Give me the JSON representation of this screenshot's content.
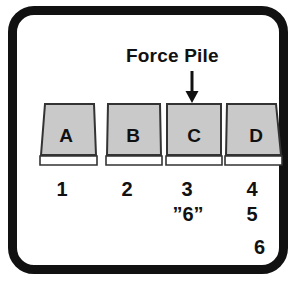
{
  "figure": {
    "title": "Force Pile",
    "arrow_icon": "down-arrow-icon",
    "corner_number": "6",
    "border_color": "#111111",
    "block_fill_color": "#c9c9c9",
    "block_stroke_color": "#333333",
    "base_fill_color": "#ffffff",
    "text_color": "#111111"
  },
  "blocks": [
    {
      "letter": "A",
      "number": "1",
      "shape": "trapezoid-lean-left"
    },
    {
      "letter": "B",
      "number": "2",
      "shape": "trapezoid-slight"
    },
    {
      "letter": "C",
      "number": "3",
      "shape": "rectangle"
    },
    {
      "letter": "D",
      "number": "4",
      "shape": "trapezoid-lean-right"
    }
  ],
  "annotations": {
    "quoted_six": "”6”",
    "five": "5"
  }
}
